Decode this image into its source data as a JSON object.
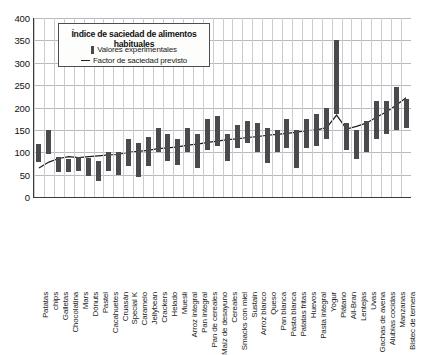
{
  "chart_data": {
    "type": "bar",
    "title": "Índice de saciedad de alimentos habituales",
    "xlabel": "",
    "ylabel": "",
    "ylim": [
      0,
      400
    ],
    "yticks": [
      0,
      50,
      100,
      150,
      200,
      250,
      300,
      350,
      400
    ],
    "grid": true,
    "legend_position": "top-left-inset",
    "legend": [
      {
        "key": "bar",
        "label": "Valores experimentales"
      },
      {
        "key": "line",
        "label": "Factor de saciedad previsto"
      }
    ],
    "categories": [
      "Patatas",
      "chips",
      "Galletas",
      "Chocolatina",
      "Mars",
      "Dónuts",
      "Pastel",
      "Cacahuetes",
      "Cruasán",
      "Special K",
      "Caramelo",
      "Jellybean",
      "Crackers",
      "Helado",
      "Muesli",
      "Arroz integral",
      "Pan integral",
      "Pan de cereales",
      "Maíz de desayuno",
      "Cereales",
      "Smacks con miel",
      "Sustain",
      "Arroz blanco",
      "Queso",
      "Pan blanca",
      "Pasta blanca",
      "Patatas fritas",
      "Huevos",
      "Pasta integral",
      "Yogur",
      "Plátano",
      "All-Bran",
      "Lentejas",
      "Uvas",
      "Gachas de avena",
      "Alubias cocidas",
      "Manzanas",
      "Bistec de ternera"
    ],
    "series": [
      {
        "name": "Valores experimentales",
        "type": "range-bar",
        "low": [
          78,
          95,
          55,
          55,
          58,
          48,
          35,
          58,
          50,
          70,
          45,
          70,
          100,
          80,
          72,
          100,
          65,
          105,
          115,
          80,
          110,
          120,
          100,
          75,
          100,
          110,
          65,
          110,
          115,
          130,
          185,
          105,
          85,
          100,
          130,
          140,
          150,
          155
        ],
        "high": [
          118,
          150,
          90,
          85,
          90,
          88,
          80,
          100,
          100,
          130,
          120,
          135,
          155,
          140,
          130,
          155,
          140,
          175,
          180,
          140,
          160,
          170,
          165,
          155,
          150,
          175,
          150,
          175,
          185,
          200,
          350,
          165,
          150,
          170,
          215,
          215,
          245,
          220
        ]
      },
      {
        "name": "Factor de saciedad previsto",
        "type": "line",
        "values": [
          65,
          78,
          86,
          90,
          88,
          90,
          92,
          94,
          95,
          100,
          102,
          104,
          108,
          110,
          112,
          116,
          118,
          122,
          125,
          128,
          130,
          133,
          135,
          138,
          140,
          142,
          145,
          148,
          150,
          155,
          183,
          152,
          158,
          165,
          178,
          190,
          205,
          222
        ]
      }
    ]
  }
}
